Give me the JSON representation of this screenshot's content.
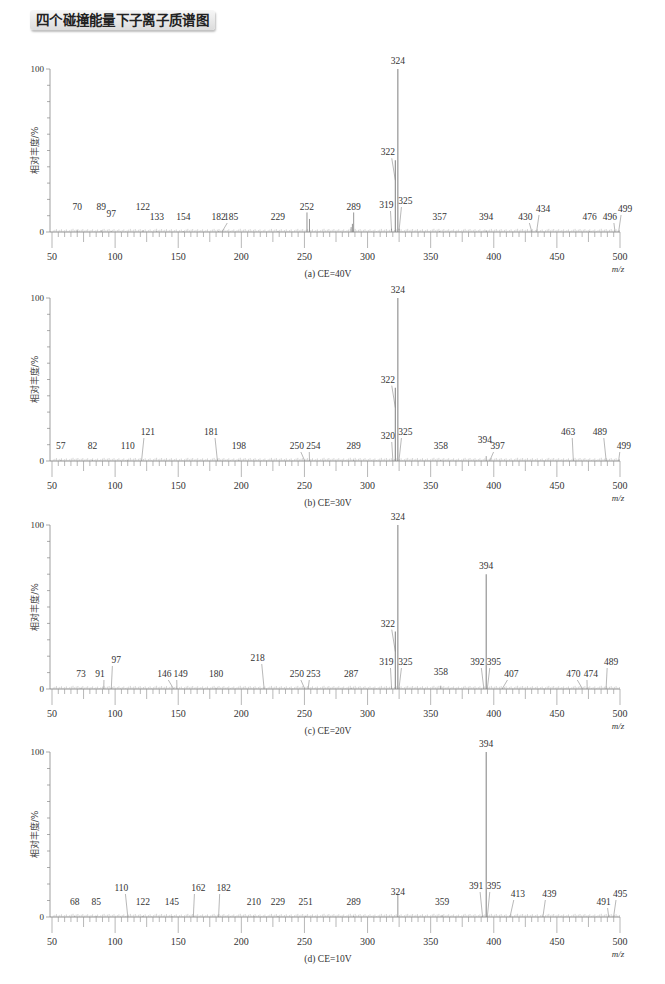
{
  "page": {
    "title": "四个碰撞能量下子离子质谱图"
  },
  "axis": {
    "ylabel": "相对丰度/%",
    "xlabel": "m/z",
    "xmin": 50,
    "xmax": 500,
    "xticks": [
      50,
      100,
      150,
      200,
      250,
      300,
      350,
      400,
      450,
      500
    ],
    "yticks_labeled": [
      0,
      100
    ]
  },
  "chart_data": [
    {
      "type": "bar",
      "subtype": "mass-spectrum",
      "title": "(a) CE=40V",
      "xlabel": "m/z",
      "ylabel": "相对丰度/%",
      "xlim": [
        50,
        500
      ],
      "ylim": [
        0,
        100
      ],
      "panel": {
        "top": 69,
        "bottom": 232
      },
      "peaks": [
        {
          "mz": 70,
          "intensity": 1,
          "label": "70",
          "lx": 70,
          "ly": 18
        },
        {
          "mz": 89,
          "intensity": 1,
          "label": "89",
          "lx": 89,
          "ly": 18
        },
        {
          "mz": 97,
          "intensity": 0.5,
          "label": "97",
          "lx": 97,
          "ly": 11
        },
        {
          "mz": 122,
          "intensity": 1,
          "label": "122",
          "lx": 122,
          "ly": 18
        },
        {
          "mz": 133,
          "intensity": 0.5,
          "label": "133",
          "lx": 133,
          "ly": 8
        },
        {
          "mz": 154,
          "intensity": 0.5,
          "label": "154",
          "lx": 154,
          "ly": 8
        },
        {
          "mz": 182,
          "intensity": 0.5,
          "label": "182",
          "lx": 182,
          "ly": 8
        },
        {
          "mz": 185,
          "intensity": 0.5,
          "label": "185",
          "lx": 192,
          "ly": 8
        },
        {
          "mz": 229,
          "intensity": 0.5,
          "label": "229",
          "lx": 229,
          "ly": 8
        },
        {
          "mz": 252,
          "intensity": 12,
          "label": "252",
          "lx": 252,
          "ly": 18
        },
        {
          "mz": 254,
          "intensity": 8,
          "label": "",
          "lx": 0,
          "ly": 0
        },
        {
          "mz": 287,
          "intensity": 3,
          "label": "",
          "lx": 0,
          "ly": 0
        },
        {
          "mz": 288,
          "intensity": 5,
          "label": "",
          "lx": 0,
          "ly": 0
        },
        {
          "mz": 289,
          "intensity": 12,
          "label": "289",
          "lx": 289,
          "ly": 18
        },
        {
          "mz": 319,
          "intensity": 2,
          "label": "319",
          "lx": 315,
          "ly": 20
        },
        {
          "mz": 322,
          "intensity": 44,
          "label": "322",
          "lx": 316,
          "ly": 54
        },
        {
          "mz": 324,
          "intensity": 100,
          "label": "324",
          "lx": 324,
          "ly": 105
        },
        {
          "mz": 325,
          "intensity": 2,
          "label": "325",
          "lx": 330,
          "ly": 24
        },
        {
          "mz": 357,
          "intensity": 0.5,
          "label": "357",
          "lx": 357,
          "ly": 8
        },
        {
          "mz": 394,
          "intensity": 1,
          "label": "394",
          "lx": 394,
          "ly": 8
        },
        {
          "mz": 430,
          "intensity": 0.5,
          "label": "430",
          "lx": 425,
          "ly": 8
        },
        {
          "mz": 434,
          "intensity": 0.5,
          "label": "434",
          "lx": 439,
          "ly": 16
        },
        {
          "mz": 476,
          "intensity": 0.5,
          "label": "476",
          "lx": 476,
          "ly": 8
        },
        {
          "mz": 496,
          "intensity": 0.5,
          "label": "496",
          "lx": 492,
          "ly": 8
        },
        {
          "mz": 499,
          "intensity": 0.5,
          "label": "499",
          "lx": 504,
          "ly": 16
        }
      ]
    },
    {
      "type": "bar",
      "subtype": "mass-spectrum",
      "title": "(b) CE=30V",
      "xlabel": "m/z",
      "ylabel": "相对丰度/%",
      "xlim": [
        50,
        500
      ],
      "ylim": [
        0,
        100
      ],
      "panel": {
        "top": 298,
        "bottom": 461
      },
      "peaks": [
        {
          "mz": 57,
          "intensity": 0.5,
          "label": "57",
          "lx": 57,
          "ly": 8
        },
        {
          "mz": 82,
          "intensity": 0.5,
          "label": "82",
          "lx": 82,
          "ly": 8
        },
        {
          "mz": 110,
          "intensity": 0.5,
          "label": "110",
          "lx": 110,
          "ly": 8
        },
        {
          "mz": 121,
          "intensity": 0.5,
          "label": "121",
          "lx": 126,
          "ly": 22
        },
        {
          "mz": 181,
          "intensity": 0.5,
          "label": "181",
          "lx": 176,
          "ly": 22
        },
        {
          "mz": 198,
          "intensity": 0.5,
          "label": "198",
          "lx": 198,
          "ly": 8
        },
        {
          "mz": 250,
          "intensity": 0.5,
          "label": "250",
          "lx": 244,
          "ly": 8
        },
        {
          "mz": 254,
          "intensity": 0.5,
          "label": "254",
          "lx": 257,
          "ly": 8
        },
        {
          "mz": 289,
          "intensity": 0.5,
          "label": "289",
          "lx": 289,
          "ly": 8
        },
        {
          "mz": 320,
          "intensity": 1,
          "label": "320",
          "lx": 316,
          "ly": 18
        },
        {
          "mz": 322,
          "intensity": 45,
          "label": "322",
          "lx": 316,
          "ly": 57
        },
        {
          "mz": 324,
          "intensity": 100,
          "label": "324",
          "lx": 324,
          "ly": 105
        },
        {
          "mz": 325,
          "intensity": 1,
          "label": "325",
          "lx": 330,
          "ly": 22
        },
        {
          "mz": 358,
          "intensity": 0.5,
          "label": "358",
          "lx": 358,
          "ly": 8
        },
        {
          "mz": 394,
          "intensity": 3,
          "label": "394",
          "lx": 393,
          "ly": 14
        },
        {
          "mz": 397,
          "intensity": 0.5,
          "label": "397",
          "lx": 403,
          "ly": 8
        },
        {
          "mz": 463,
          "intensity": 0.5,
          "label": "463",
          "lx": 459,
          "ly": 22
        },
        {
          "mz": 489,
          "intensity": 0.5,
          "label": "489",
          "lx": 484,
          "ly": 22
        },
        {
          "mz": 499,
          "intensity": 0.5,
          "label": "499",
          "lx": 503,
          "ly": 8
        }
      ]
    },
    {
      "type": "bar",
      "subtype": "mass-spectrum",
      "title": "(c) CE=20V",
      "xlabel": "m/z",
      "ylabel": "相对丰度/%",
      "xlim": [
        50,
        500
      ],
      "ylim": [
        0,
        100
      ],
      "panel": {
        "top": 525,
        "bottom": 689
      },
      "peaks": [
        {
          "mz": 73,
          "intensity": 0.5,
          "label": "73",
          "lx": 73,
          "ly": 8
        },
        {
          "mz": 91,
          "intensity": 0.5,
          "label": "91",
          "lx": 88,
          "ly": 8
        },
        {
          "mz": 97,
          "intensity": 0.5,
          "label": "97",
          "lx": 101,
          "ly": 22
        },
        {
          "mz": 146,
          "intensity": 0.5,
          "label": "146",
          "lx": 139,
          "ly": 8
        },
        {
          "mz": 149,
          "intensity": 0.5,
          "label": "149",
          "lx": 152,
          "ly": 8
        },
        {
          "mz": 180,
          "intensity": 0.5,
          "label": "180",
          "lx": 180,
          "ly": 8
        },
        {
          "mz": 218,
          "intensity": 0.5,
          "label": "218",
          "lx": 213,
          "ly": 24
        },
        {
          "mz": 250,
          "intensity": 0.5,
          "label": "250",
          "lx": 244,
          "ly": 8
        },
        {
          "mz": 253,
          "intensity": 0.5,
          "label": "253",
          "lx": 257,
          "ly": 8
        },
        {
          "mz": 287,
          "intensity": 0.5,
          "label": "287",
          "lx": 287,
          "ly": 8
        },
        {
          "mz": 319,
          "intensity": 1,
          "label": "319",
          "lx": 315,
          "ly": 20
        },
        {
          "mz": 322,
          "intensity": 35,
          "label": "322",
          "lx": 316,
          "ly": 47
        },
        {
          "mz": 324,
          "intensity": 100,
          "label": "324",
          "lx": 324,
          "ly": 105
        },
        {
          "mz": 325,
          "intensity": 1,
          "label": "325",
          "lx": 330,
          "ly": 20
        },
        {
          "mz": 358,
          "intensity": 2,
          "label": "358",
          "lx": 358,
          "ly": 10
        },
        {
          "mz": 392,
          "intensity": 1,
          "label": "392",
          "lx": 387,
          "ly": 20
        },
        {
          "mz": 394,
          "intensity": 70,
          "label": "394",
          "lx": 394,
          "ly": 77
        },
        {
          "mz": 395,
          "intensity": 1,
          "label": "395",
          "lx": 400,
          "ly": 20
        },
        {
          "mz": 407,
          "intensity": 0.5,
          "label": "407",
          "lx": 414,
          "ly": 8
        },
        {
          "mz": 470,
          "intensity": 0.5,
          "label": "470",
          "lx": 463,
          "ly": 8
        },
        {
          "mz": 474,
          "intensity": 0.5,
          "label": "474",
          "lx": 477,
          "ly": 8
        },
        {
          "mz": 489,
          "intensity": 0.5,
          "label": "489",
          "lx": 493,
          "ly": 20
        }
      ]
    },
    {
      "type": "bar",
      "subtype": "mass-spectrum",
      "title": "(d) CE=10V",
      "xlabel": "m/z",
      "ylabel": "相对丰度/%",
      "xlim": [
        50,
        500
      ],
      "ylim": [
        0,
        100
      ],
      "panel": {
        "top": 752,
        "bottom": 917
      },
      "peaks": [
        {
          "mz": 68,
          "intensity": 0.5,
          "label": "68",
          "lx": 68,
          "ly": 8
        },
        {
          "mz": 85,
          "intensity": 0.5,
          "label": "85",
          "lx": 85,
          "ly": 8
        },
        {
          "mz": 110,
          "intensity": 0.5,
          "label": "110",
          "lx": 105,
          "ly": 22
        },
        {
          "mz": 122,
          "intensity": 0.5,
          "label": "122",
          "lx": 122,
          "ly": 8
        },
        {
          "mz": 145,
          "intensity": 0.5,
          "label": "145",
          "lx": 145,
          "ly": 8
        },
        {
          "mz": 162,
          "intensity": 0.5,
          "label": "162",
          "lx": 166,
          "ly": 22
        },
        {
          "mz": 182,
          "intensity": 0.5,
          "label": "182",
          "lx": 186,
          "ly": 22
        },
        {
          "mz": 210,
          "intensity": 0.5,
          "label": "210",
          "lx": 210,
          "ly": 8
        },
        {
          "mz": 229,
          "intensity": 0.5,
          "label": "229",
          "lx": 229,
          "ly": 8
        },
        {
          "mz": 251,
          "intensity": 0.5,
          "label": "251",
          "lx": 251,
          "ly": 8
        },
        {
          "mz": 289,
          "intensity": 0.5,
          "label": "289",
          "lx": 289,
          "ly": 8
        },
        {
          "mz": 324,
          "intensity": 14,
          "label": "324",
          "lx": 324,
          "ly": 18
        },
        {
          "mz": 359,
          "intensity": 1,
          "label": "359",
          "lx": 359,
          "ly": 8
        },
        {
          "mz": 391,
          "intensity": 1,
          "label": "391",
          "lx": 386,
          "ly": 24
        },
        {
          "mz": 394,
          "intensity": 100,
          "label": "394",
          "lx": 394,
          "ly": 105
        },
        {
          "mz": 395,
          "intensity": 1,
          "label": "395",
          "lx": 400,
          "ly": 24
        },
        {
          "mz": 413,
          "intensity": 0.5,
          "label": "413",
          "lx": 419,
          "ly": 16
        },
        {
          "mz": 439,
          "intensity": 0.5,
          "label": "439",
          "lx": 444,
          "ly": 16
        },
        {
          "mz": 491,
          "intensity": 0.5,
          "label": "491",
          "lx": 487,
          "ly": 8
        },
        {
          "mz": 495,
          "intensity": 0.5,
          "label": "495",
          "lx": 500,
          "ly": 16
        }
      ]
    }
  ]
}
